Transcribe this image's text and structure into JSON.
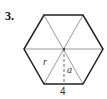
{
  "problem": {
    "number": "3."
  },
  "figure": {
    "shape": "regular hexagon",
    "labels": {
      "radius": "r",
      "apothem": "a",
      "side": "4"
    },
    "colors": {
      "outline": "#222222",
      "inner_lines": "#999999"
    }
  }
}
